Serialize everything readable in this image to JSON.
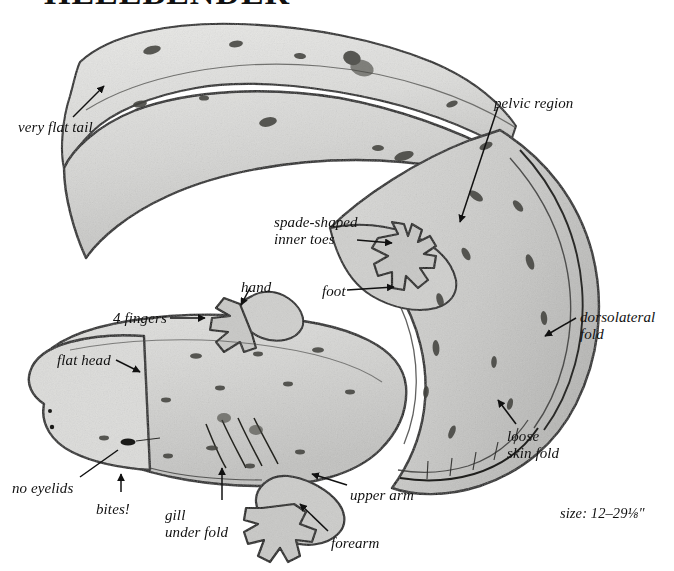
{
  "page": {
    "title": "HELLBENDER",
    "size_note": "size: 12–29⅛″",
    "background": "#ffffff",
    "ink": "#111111"
  },
  "subject": {
    "common_name": "Hellbender",
    "illustration_style": "pencil field-guide plate",
    "body_fill": "#d8d8d6",
    "body_shadow": "#bdbdbb",
    "outline": "#1a1a1a",
    "speckle": "#4a4a48"
  },
  "labels": [
    {
      "id": "very-flat-tail",
      "text": "very flat tail",
      "lines": [
        "very flat tail"
      ],
      "x": 18,
      "y": 119,
      "align": "left"
    },
    {
      "id": "pelvic-region",
      "text": "pelvic region",
      "lines": [
        "pelvic region"
      ],
      "x": 494,
      "y": 95,
      "align": "left"
    },
    {
      "id": "spade-shaped",
      "text": "spade-shaped inner toes",
      "lines": [
        "spade-shaped",
        "inner toes"
      ],
      "x": 274,
      "y": 214,
      "align": "left"
    },
    {
      "id": "hand",
      "text": "hand",
      "lines": [
        "hand"
      ],
      "x": 241,
      "y": 279,
      "align": "left"
    },
    {
      "id": "foot",
      "text": "foot",
      "lines": [
        "foot"
      ],
      "x": 322,
      "y": 283,
      "align": "left"
    },
    {
      "id": "four-fingers",
      "text": "4 fingers",
      "lines": [
        "4 fingers"
      ],
      "x": 113,
      "y": 310,
      "align": "left"
    },
    {
      "id": "dorsolateral-fold",
      "text": "dorsolateral fold",
      "lines": [
        "dorsolateral",
        "fold"
      ],
      "x": 580,
      "y": 309,
      "align": "left"
    },
    {
      "id": "flat-head",
      "text": "flat head",
      "lines": [
        "flat head"
      ],
      "x": 57,
      "y": 352,
      "align": "left"
    },
    {
      "id": "loose-skin-fold",
      "text": "loose skin fold",
      "lines": [
        "loose",
        "skin fold"
      ],
      "x": 507,
      "y": 428,
      "align": "left"
    },
    {
      "id": "no-eyelids",
      "text": "no eyelids",
      "lines": [
        "no eyelids"
      ],
      "x": 12,
      "y": 480,
      "align": "left"
    },
    {
      "id": "bites",
      "text": "bites!",
      "lines": [
        "bites!"
      ],
      "x": 96,
      "y": 501,
      "align": "left"
    },
    {
      "id": "gill-under-fold",
      "text": "gill under fold",
      "lines": [
        "gill",
        "under fold"
      ],
      "x": 165,
      "y": 507,
      "align": "left"
    },
    {
      "id": "upper-arm",
      "text": "upper arm",
      "lines": [
        "upper arm"
      ],
      "x": 350,
      "y": 487,
      "align": "left"
    },
    {
      "id": "forearm",
      "text": "forearm",
      "lines": [
        "forearm"
      ],
      "x": 331,
      "y": 535,
      "align": "left"
    }
  ],
  "leaders": [
    {
      "id": "leader-very-flat-tail",
      "from": [
        73,
        117
      ],
      "to": [
        104,
        86
      ],
      "arrow": true
    },
    {
      "id": "leader-pelvic-region",
      "from": [
        498,
        107
      ],
      "to": [
        460,
        222
      ],
      "arrow": true
    },
    {
      "id": "leader-spade-shaped",
      "from": [
        357,
        240
      ],
      "to": [
        392,
        243
      ],
      "arrow": true
    },
    {
      "id": "leader-hand",
      "from": [
        250,
        288
      ],
      "to": [
        241,
        305
      ],
      "arrow": true
    },
    {
      "id": "leader-foot",
      "from": [
        347,
        290
      ],
      "to": [
        394,
        287
      ],
      "arrow": true
    },
    {
      "id": "leader-four-fingers",
      "from": [
        170,
        318
      ],
      "to": [
        205,
        318
      ],
      "arrow": true
    },
    {
      "id": "leader-dorsolateral-fold",
      "from": [
        576,
        318
      ],
      "to": [
        545,
        336
      ],
      "arrow": true
    },
    {
      "id": "leader-flat-head",
      "from": [
        116,
        360
      ],
      "to": [
        140,
        372
      ],
      "arrow": true
    },
    {
      "id": "leader-loose-skin-fold",
      "from": [
        516,
        424
      ],
      "to": [
        498,
        400
      ],
      "arrow": true
    },
    {
      "id": "leader-no-eyelids",
      "from": [
        80,
        477
      ],
      "to": [
        118,
        450
      ],
      "arrow": false
    },
    {
      "id": "leader-bites",
      "from": [
        121,
        492
      ],
      "to": [
        121,
        474
      ],
      "arrow": true
    },
    {
      "id": "leader-gill-under-fold",
      "from": [
        222,
        500
      ],
      "to": [
        222,
        468
      ],
      "arrow": true
    },
    {
      "id": "leader-upper-arm",
      "from": [
        347,
        485
      ],
      "to": [
        312,
        474
      ],
      "arrow": true
    },
    {
      "id": "leader-forearm",
      "from": [
        328,
        531
      ],
      "to": [
        300,
        504
      ],
      "arrow": true
    }
  ],
  "anatomy_callouts": [
    "very flat tail",
    "pelvic region",
    "spade-shaped inner toes",
    "hand",
    "foot",
    "4 fingers",
    "dorsolateral fold",
    "flat head",
    "loose skin fold",
    "no eyelids",
    "bites!",
    "gill under fold",
    "upper arm",
    "forearm"
  ]
}
